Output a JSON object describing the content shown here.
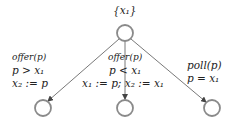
{
  "diagram": {
    "colors": {
      "node_stroke": "#8a8a8a",
      "edge": "#555555",
      "text": "#222222"
    },
    "root": {
      "label": "{x₁}",
      "cx": 125,
      "cy": 33,
      "r": 8
    },
    "children": [
      {
        "id": "left",
        "cx": 43,
        "cy": 108,
        "r": 8
      },
      {
        "id": "middle",
        "cx": 125,
        "cy": 108,
        "r": 8
      },
      {
        "id": "right",
        "cx": 212,
        "cy": 108,
        "r": 8
      }
    ],
    "edges": [
      {
        "from": "root",
        "to": "left",
        "lines": [
          "offer(p)",
          "p > x₁",
          "x₂ := p"
        ]
      },
      {
        "from": "root",
        "to": "middle",
        "lines": [
          "offer(p)",
          "p < x₁",
          "x₁ := p; x₂ := x₁"
        ]
      },
      {
        "from": "root",
        "to": "right",
        "lines": [
          "poll(p)",
          "p = x₁"
        ]
      }
    ]
  }
}
